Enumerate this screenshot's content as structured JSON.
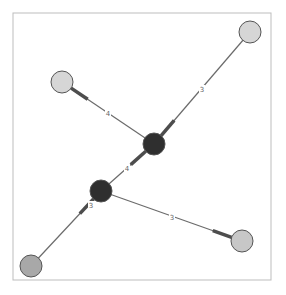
{
  "diagram": {
    "type": "network-graph",
    "frame": {
      "x": 13,
      "y": 13,
      "width": 258,
      "height": 267,
      "stroke": "#bdbdbd"
    },
    "colors": {
      "edge": "#6b6b6b",
      "edge_head": "#4d4d4d",
      "node_stroke": "#555555",
      "label_bg": "#ffffff"
    },
    "nodes": [
      {
        "id": "A",
        "x": 154,
        "y": 144,
        "r": 11,
        "fill": "#2f2f2f",
        "label": ""
      },
      {
        "id": "B",
        "x": 101,
        "y": 191,
        "r": 11,
        "fill": "#2f2f2f",
        "label": ""
      },
      {
        "id": "C",
        "x": 250,
        "y": 32,
        "r": 11,
        "fill": "#d6d6d6",
        "label": ""
      },
      {
        "id": "D",
        "x": 62,
        "y": 82,
        "r": 11,
        "fill": "#d6d6d6",
        "label": ""
      },
      {
        "id": "E",
        "x": 242,
        "y": 241,
        "r": 11,
        "fill": "#c7c7c7",
        "label": ""
      },
      {
        "id": "F",
        "x": 31,
        "y": 266,
        "r": 11,
        "fill": "#a8a8a8",
        "label": ""
      }
    ],
    "edges": [
      {
        "source": "C",
        "target": "A",
        "label": "3",
        "label_x": 202,
        "label_y": 89
      },
      {
        "source": "A",
        "target": "D",
        "label": "4",
        "label_x": 108,
        "label_y": 113
      },
      {
        "source": "B",
        "target": "A",
        "label": "4",
        "label_x": 127,
        "label_y": 168
      },
      {
        "source": "F",
        "target": "B",
        "label": "3",
        "label_x": 91,
        "label_y": 205
      },
      {
        "source": "B",
        "target": "E",
        "label": "3",
        "label_x": 172,
        "label_y": 217
      }
    ]
  }
}
